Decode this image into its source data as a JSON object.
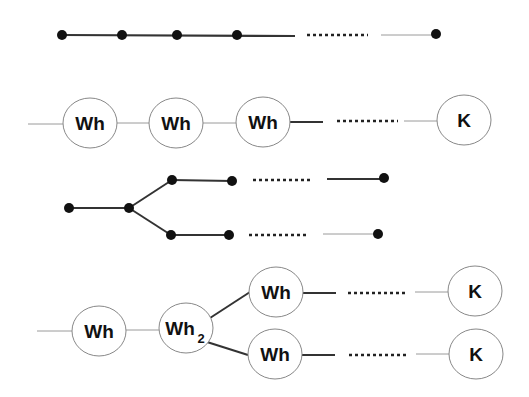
{
  "diagram": {
    "title": "",
    "colors": {
      "line": "#333333",
      "thin_line": "#9a9a9a",
      "node_stroke": "#888888",
      "dot": "#111111",
      "text": "#111111",
      "background": "#ffffff"
    },
    "rows": [
      {
        "id": "linear-chain-dots",
        "description": "Linear chain of black dots with ellipsis",
        "dots": [
          [
            62,
            35
          ],
          [
            122,
            35
          ],
          [
            177,
            35
          ],
          [
            237,
            35
          ],
          [
            436,
            35
          ]
        ],
        "ellipsis": {
          "from": [
            307,
            35
          ],
          "to": [
            368,
            35
          ]
        }
      },
      {
        "id": "linear-chain-labeled",
        "description": "Linear chain of labeled nodes",
        "nodes": [
          {
            "label": "Wh",
            "cx": 90,
            "cy": 123
          },
          {
            "label": "Wh",
            "cx": 176,
            "cy": 123
          },
          {
            "label": "Wh",
            "cx": 262,
            "cy": 122
          },
          {
            "label": "K",
            "cx": 464,
            "cy": 120
          }
        ],
        "ellipsis": {
          "from": [
            337,
            121
          ],
          "to": [
            398,
            121
          ]
        }
      },
      {
        "id": "branched-chain-dots",
        "description": "Branched chain of black dots with two ellipsis branches",
        "dots": [
          [
            69,
            208
          ],
          [
            129,
            208
          ],
          [
            172,
            180
          ],
          [
            232,
            180
          ],
          [
            384,
            178
          ],
          [
            171,
            235
          ],
          [
            229,
            235
          ],
          [
            378,
            234
          ]
        ],
        "ellipses": [
          {
            "from": [
              253,
              179
            ],
            "to": [
              313,
              179
            ]
          },
          {
            "from": [
              249,
              235
            ],
            "to": [
              309,
              235
            ]
          }
        ]
      },
      {
        "id": "branched-chain-labeled",
        "description": "Branched chain of labeled nodes",
        "nodes": [
          {
            "label": "Wh",
            "subscript": "",
            "cx": 99,
            "cy": 331
          },
          {
            "label": "Wh",
            "subscript": "2",
            "cx": 186,
            "cy": 328
          },
          {
            "label": "Wh",
            "subscript": "",
            "cx": 276,
            "cy": 292
          },
          {
            "label": "Wh",
            "subscript": "",
            "cx": 275,
            "cy": 354
          },
          {
            "label": "K",
            "subscript": "",
            "cx": 475,
            "cy": 291
          },
          {
            "label": "K",
            "subscript": "",
            "cx": 476,
            "cy": 354
          }
        ],
        "ellipses": [
          {
            "from": [
              348,
              292
            ],
            "to": [
              408,
              292
            ]
          },
          {
            "from": [
              349,
              355
            ],
            "to": [
              409,
              355
            ]
          }
        ]
      }
    ]
  }
}
